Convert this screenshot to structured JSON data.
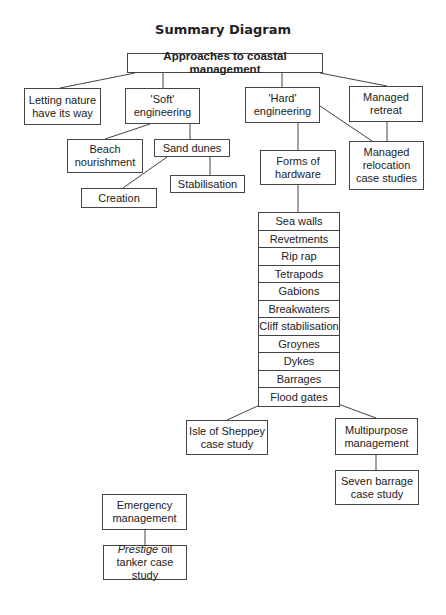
{
  "title": "Summary Diagram",
  "nodes": {
    "root": "Approaches to coastal management",
    "letting_nature": "Letting nature have its way",
    "soft": "'Soft' engineering",
    "hard": "'Hard' engineering",
    "managed_retreat": "Managed retreat",
    "beach_nourishment": "Beach nourishment",
    "sand_dunes": "Sand dunes",
    "stabilisation": "Stabilisation",
    "creation": "Creation",
    "forms_of_hardware": "Forms of hardware",
    "managed_relocation": "Managed relocation case studies",
    "isle_of_sheppey": "Isle of Sheppey case study",
    "multipurpose": "Multipurpose management",
    "seven_barrage": "Seven barrage case study",
    "emergency": "Emergency management",
    "prestige_italic": "Prestige",
    "prestige_rest": " oil tanker case study"
  },
  "hardware_list": [
    "Sea walls",
    "Revetments",
    "Rip rap",
    "Tetrapods",
    "Gabions",
    "Breakwaters",
    "Cliff stabilisation",
    "Groynes",
    "Dykes",
    "Barrages",
    "Flood gates"
  ],
  "colors": {
    "line": "#444444",
    "text": "#222222",
    "background": "#ffffff"
  }
}
